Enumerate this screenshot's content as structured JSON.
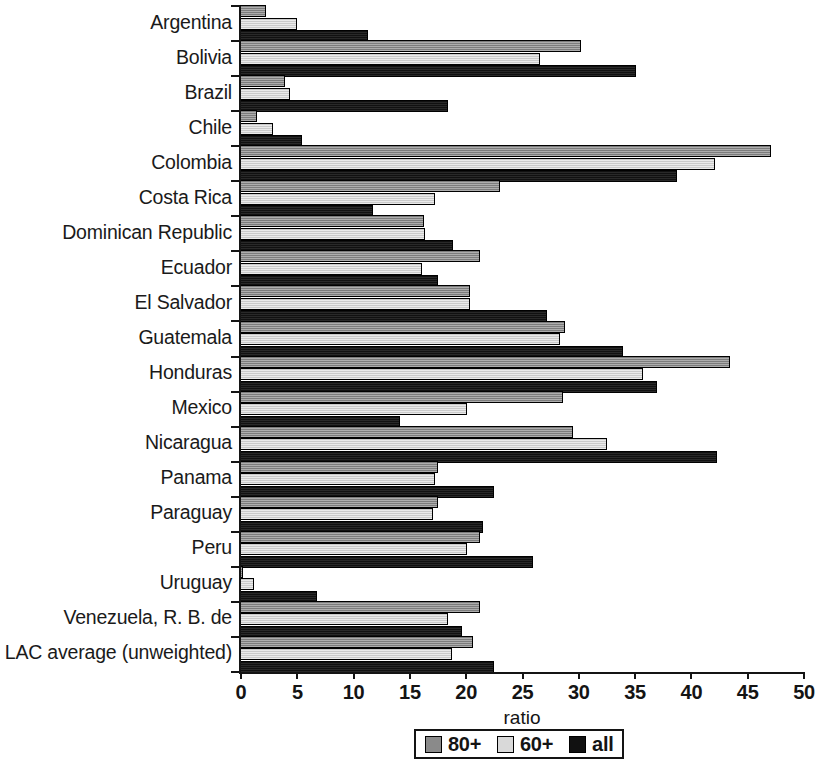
{
  "chart_data": {
    "type": "bar",
    "orientation": "horizontal",
    "title": "",
    "xlabel": "ratio",
    "ylabel": "",
    "xlim": [
      0,
      50
    ],
    "xticks": [
      0,
      5,
      10,
      15,
      20,
      25,
      30,
      35,
      40,
      45,
      50
    ],
    "grid": false,
    "legend_position": "bottom-center",
    "categories": [
      "Argentina",
      "Bolivia",
      "Brazil",
      "Chile",
      "Colombia",
      "Costa Rica",
      "Dominican Republic",
      "Ecuador",
      "El Salvador",
      "Guatemala",
      "Honduras",
      "Mexico",
      "Nicaragua",
      "Panama",
      "Paraguay",
      "Peru",
      "Uruguay",
      "Venezuela, R. B. de",
      "LAC average (unweighted)"
    ],
    "series": [
      {
        "name": "80+",
        "color": "#8a8a8a",
        "values": [
          2.3,
          30.3,
          4.0,
          1.5,
          47.2,
          23.1,
          16.3,
          21.3,
          20.4,
          28.9,
          43.5,
          28.7,
          29.6,
          17.6,
          17.6,
          21.3,
          0.3,
          21.3,
          20.7
        ]
      },
      {
        "name": "60+",
        "color": "#d9d9d9",
        "values": [
          5.1,
          26.6,
          4.4,
          2.9,
          42.2,
          17.3,
          16.4,
          16.2,
          20.4,
          28.4,
          35.8,
          20.2,
          32.6,
          17.3,
          17.1,
          20.2,
          1.2,
          18.5,
          18.8
        ]
      },
      {
        "name": "all",
        "color": "#111111",
        "values": [
          11.4,
          35.2,
          18.5,
          5.5,
          38.8,
          11.8,
          18.9,
          17.6,
          27.3,
          34.0,
          37.0,
          14.2,
          42.4,
          22.6,
          21.6,
          26.0,
          6.8,
          19.7,
          22.6
        ]
      }
    ]
  }
}
